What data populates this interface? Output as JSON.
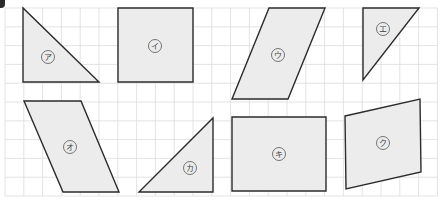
{
  "diagram": {
    "grid": {
      "x0": 5,
      "y0": 8,
      "cell": 18.8,
      "cols": 23,
      "rows": 10,
      "line_color": "#dcdcdc"
    },
    "colors": {
      "fill": "#ececec",
      "stroke": "#2b2b2b",
      "label_circle": "#555555",
      "label_text": "#444444"
    },
    "shapes": [
      {
        "id": "a",
        "label": "ア",
        "type": "right-triangle",
        "points": [
          [
            23,
            8
          ],
          [
            23,
            82
          ],
          [
            99,
            82
          ]
        ],
        "label_pos": [
          48,
          57
        ]
      },
      {
        "id": "i",
        "label": "イ",
        "type": "square",
        "points": [
          [
            118,
            8
          ],
          [
            193,
            8
          ],
          [
            193,
            82
          ],
          [
            118,
            82
          ]
        ],
        "label_pos": [
          155,
          46
        ]
      },
      {
        "id": "u",
        "label": "ウ",
        "type": "parallelogram",
        "points": [
          [
            269,
            8
          ],
          [
            325,
            8
          ],
          [
            288,
            99
          ],
          [
            232,
            99
          ]
        ],
        "label_pos": [
          278,
          55
        ]
      },
      {
        "id": "e",
        "label": "エ",
        "type": "right-triangle",
        "points": [
          [
            363,
            8
          ],
          [
            419,
            8
          ],
          [
            363,
            80
          ]
        ],
        "label_pos": [
          383,
          29
        ]
      },
      {
        "id": "o",
        "label": "オ",
        "type": "parallelogram",
        "points": [
          [
            24,
            101
          ],
          [
            81,
            101
          ],
          [
            119,
            192
          ],
          [
            63,
            192
          ]
        ],
        "label_pos": [
          70,
          147
        ]
      },
      {
        "id": "ka",
        "label": "カ",
        "type": "right-triangle",
        "points": [
          [
            213,
            118
          ],
          [
            213,
            192
          ],
          [
            139,
            192
          ]
        ],
        "label_pos": [
          190,
          168
        ]
      },
      {
        "id": "ki",
        "label": "キ",
        "type": "rectangle",
        "points": [
          [
            232,
            117
          ],
          [
            326,
            117
          ],
          [
            326,
            191
          ],
          [
            232,
            191
          ]
        ],
        "label_pos": [
          279,
          154
        ]
      },
      {
        "id": "ku",
        "label": "ク",
        "type": "parallelogram",
        "points": [
          [
            345,
            116
          ],
          [
            420,
            99
          ],
          [
            421,
            172
          ],
          [
            346,
            189
          ]
        ],
        "label_pos": [
          383,
          143
        ]
      }
    ]
  }
}
